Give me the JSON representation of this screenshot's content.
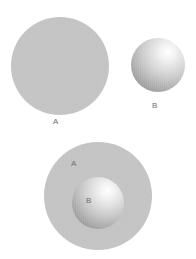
{
  "figure": {
    "background_color": "#ffffff",
    "width": 196,
    "height": 259,
    "label_color": "#6e6e6e"
  },
  "panels": [
    {
      "id": "separate-sets",
      "name": "Disjoint sets A and B",
      "shapes": [
        {
          "id": "top-circle-a",
          "set_label": "A",
          "style": "flat",
          "fill_color": "#c3c3c3",
          "cx": 60,
          "cy": 66,
          "diameter": 98
        },
        {
          "id": "top-circle-b",
          "set_label": "B",
          "style": "sphere",
          "fill_color": "#cacaca",
          "highlight_color": "#ffffff",
          "shadow_color": "#8a8a8a",
          "cx": 158,
          "cy": 65,
          "diameter": 54
        }
      ],
      "labels": [
        {
          "id": "label-top-a",
          "text": "A",
          "x": 53,
          "y": 117
        },
        {
          "id": "label-top-b",
          "text": "B",
          "x": 152,
          "y": 101
        }
      ]
    },
    {
      "id": "nested-sets",
      "name": "Set B contained in set A",
      "shapes": [
        {
          "id": "bottom-circle-a",
          "set_label": "A",
          "style": "flat",
          "fill_color": "#c3c3c3",
          "cx": 98,
          "cy": 196,
          "diameter": 108
        },
        {
          "id": "bottom-circle-b",
          "set_label": "B",
          "style": "sphere",
          "fill_color": "#cacaca",
          "highlight_color": "#ffffff",
          "shadow_color": "#8a8a8a",
          "cx": 98,
          "cy": 203,
          "diameter": 52
        }
      ],
      "labels": [
        {
          "id": "label-bottom-a",
          "text": "A",
          "x": 71,
          "y": 159
        },
        {
          "id": "label-bottom-b",
          "text": "B",
          "x": 86,
          "y": 196
        }
      ]
    }
  ]
}
